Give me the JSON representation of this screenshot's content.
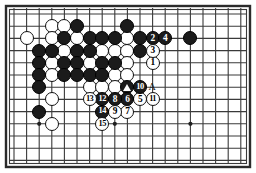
{
  "diagram": {
    "type": "go-board-problem-diagram",
    "board_size": 19,
    "visible_columns": 19,
    "visible_rows": 13,
    "background_color": "#ffffff",
    "line_color": "#3a3a3a",
    "border_color": "#2b2b2b",
    "black_color": "#1b1b1b",
    "white_color": "#ffffff",
    "geometry": {
      "origin_x": 14,
      "origin_y": 14,
      "step_x": 12.6,
      "step_y": 12.2,
      "stone_diameter": 14,
      "frame_x": 6,
      "frame_y": 6,
      "frame_w": 244,
      "frame_h": 161
    },
    "star_points": [
      {
        "col": 2,
        "row": 9
      },
      {
        "col": 8,
        "row": 9
      },
      {
        "col": 14,
        "row": 9
      }
    ],
    "plain_black_stones": [
      {
        "col": 5,
        "row": 1
      },
      {
        "col": 4,
        "row": 2
      },
      {
        "col": 6,
        "row": 2
      },
      {
        "col": 7,
        "row": 2
      },
      {
        "col": 8,
        "row": 2
      },
      {
        "col": 10,
        "row": 2
      },
      {
        "col": 2,
        "row": 3
      },
      {
        "col": 3,
        "row": 3
      },
      {
        "col": 5,
        "row": 3
      },
      {
        "col": 6,
        "row": 3
      },
      {
        "col": 2,
        "row": 4
      },
      {
        "col": 4,
        "row": 4
      },
      {
        "col": 5,
        "row": 4
      },
      {
        "col": 7,
        "row": 4
      },
      {
        "col": 8,
        "row": 4
      },
      {
        "col": 2,
        "row": 5
      },
      {
        "col": 4,
        "row": 5
      },
      {
        "col": 5,
        "row": 5
      },
      {
        "col": 6,
        "row": 5
      },
      {
        "col": 7,
        "row": 5
      },
      {
        "col": 2,
        "row": 6
      },
      {
        "col": 2,
        "row": 8
      },
      {
        "col": 14,
        "row": 2
      },
      {
        "col": 9,
        "row": 1
      },
      {
        "col": 10,
        "row": 3
      }
    ],
    "plain_white_stones": [
      {
        "col": 3,
        "row": 1
      },
      {
        "col": 4,
        "row": 1
      },
      {
        "col": 1,
        "row": 2
      },
      {
        "col": 3,
        "row": 2
      },
      {
        "col": 5,
        "row": 2
      },
      {
        "col": 9,
        "row": 2
      },
      {
        "col": 4,
        "row": 3
      },
      {
        "col": 7,
        "row": 3
      },
      {
        "col": 8,
        "row": 3
      },
      {
        "col": 9,
        "row": 3
      },
      {
        "col": 3,
        "row": 4
      },
      {
        "col": 6,
        "row": 4
      },
      {
        "col": 9,
        "row": 4
      },
      {
        "col": 3,
        "row": 5
      },
      {
        "col": 8,
        "row": 5
      },
      {
        "col": 9,
        "row": 5
      },
      {
        "col": 6,
        "row": 6
      },
      {
        "col": 7,
        "row": 6
      },
      {
        "col": 8,
        "row": 6
      },
      {
        "col": 3,
        "row": 7
      },
      {
        "col": 3,
        "row": 9
      }
    ],
    "marked_stones": [
      {
        "col": 9,
        "row": 6,
        "color": "black",
        "marker": "triangle"
      }
    ],
    "letter_labels": [
      {
        "col": 11,
        "row": 6,
        "text": "A"
      }
    ],
    "numbered_moves": [
      {
        "n": "1",
        "col": 11,
        "row": 4,
        "color": "white"
      },
      {
        "n": "2",
        "col": 11,
        "row": 2,
        "color": "black"
      },
      {
        "n": "3",
        "col": 11,
        "row": 3,
        "color": "white"
      },
      {
        "n": "4",
        "col": 12,
        "row": 2,
        "color": "black"
      },
      {
        "n": "5",
        "col": 10,
        "row": 7,
        "color": "white"
      },
      {
        "n": "6",
        "col": 9,
        "row": 7,
        "color": "black"
      },
      {
        "n": "7",
        "col": 9,
        "row": 8,
        "color": "white"
      },
      {
        "n": "8",
        "col": 8,
        "row": 7,
        "color": "black"
      },
      {
        "n": "9",
        "col": 8,
        "row": 8,
        "color": "white"
      },
      {
        "n": "10",
        "col": 10,
        "row": 6,
        "color": "black"
      },
      {
        "n": "11",
        "col": 11,
        "row": 7,
        "color": "white"
      },
      {
        "n": "12",
        "col": 7,
        "row": 7,
        "color": "black"
      },
      {
        "n": "13",
        "col": 6,
        "row": 7,
        "color": "white"
      },
      {
        "n": "14",
        "col": 7,
        "row": 8,
        "color": "black"
      },
      {
        "n": "15",
        "col": 7,
        "row": 9,
        "color": "white"
      }
    ]
  }
}
